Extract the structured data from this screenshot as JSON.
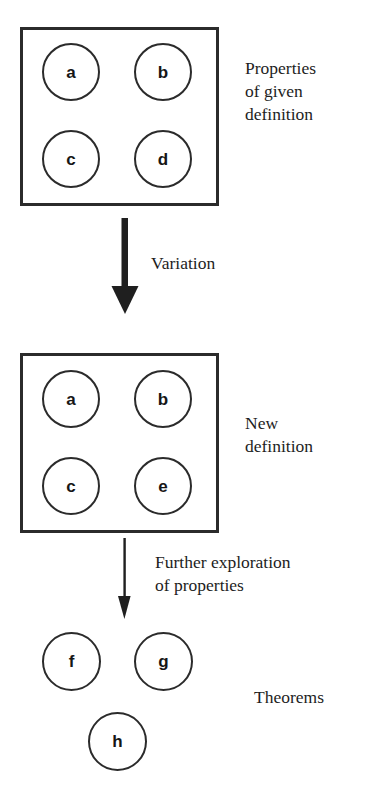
{
  "diagram": {
    "boxes": [
      {
        "id": "given-definition",
        "caption": "Properties\nof given\ndefinition",
        "circles": [
          {
            "id": "a",
            "label": "a"
          },
          {
            "id": "b",
            "label": "b"
          },
          {
            "id": "c",
            "label": "c"
          },
          {
            "id": "d",
            "label": "d"
          }
        ]
      },
      {
        "id": "new-definition",
        "caption": "New\ndefinition",
        "circles": [
          {
            "id": "a2",
            "label": "a"
          },
          {
            "id": "b2",
            "label": "b"
          },
          {
            "id": "c2",
            "label": "c"
          },
          {
            "id": "e2",
            "label": "e"
          }
        ]
      }
    ],
    "arrows": [
      {
        "id": "variation",
        "label": "Variation",
        "style": "thick"
      },
      {
        "id": "exploration",
        "label": "Further exploration\nof properties",
        "style": "thin"
      }
    ],
    "theorems": {
      "caption": "Theorems",
      "circles": [
        {
          "id": "f",
          "label": "f"
        },
        {
          "id": "g",
          "label": "g"
        },
        {
          "id": "h",
          "label": "h"
        }
      ]
    },
    "colors": {
      "stroke": "#2b2b2b",
      "text": "#1d1d1d",
      "background": "#ffffff"
    }
  }
}
